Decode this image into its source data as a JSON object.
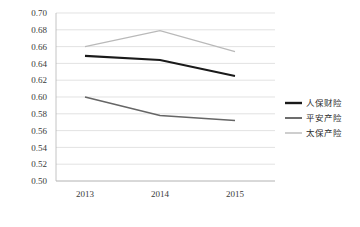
{
  "chart_data": {
    "type": "line",
    "title": "",
    "subtitle": "",
    "xlabel": "",
    "ylabel": "",
    "categories": [
      "2013",
      "2014",
      "2015"
    ],
    "ylim": [
      0.5,
      0.7
    ],
    "ytick_step": 0.02,
    "yticks": [
      "0.70",
      "0.68",
      "0.66",
      "0.64",
      "0.62",
      "0.60",
      "0.58",
      "0.56",
      "0.54",
      "0.52",
      "0.50"
    ],
    "ytick_values": [
      0.7,
      0.68,
      0.66,
      0.64,
      0.62,
      0.6,
      0.58,
      0.56,
      0.54,
      0.52,
      0.5
    ],
    "grid": true,
    "grid_axis": "y",
    "legend_position": "right",
    "markers": false,
    "series": [
      {
        "name": "人保财险",
        "values": [
          0.649,
          0.644,
          0.625
        ],
        "color": "#1a1a1a",
        "width": 2.1
      },
      {
        "name": "平安产险",
        "values": [
          0.6,
          0.578,
          0.572
        ],
        "color": "#666666",
        "width": 1.7
      },
      {
        "name": "太保产险",
        "values": [
          0.66,
          0.679,
          0.654
        ],
        "color": "#b9b9b9",
        "width": 1.3
      }
    ]
  },
  "legend": {
    "items": [
      {
        "label": "人保财险",
        "color": "#1a1a1a",
        "width": 2.4
      },
      {
        "label": "平安产险",
        "color": "#666666",
        "width": 1.9
      },
      {
        "label": "太保产险",
        "color": "#b9b9b9",
        "width": 1.4
      }
    ]
  },
  "colors": {
    "background": "#ffffff",
    "grid": "#d6d6d6",
    "axis": "#b5b5b5",
    "text": "#3a3a3a"
  }
}
